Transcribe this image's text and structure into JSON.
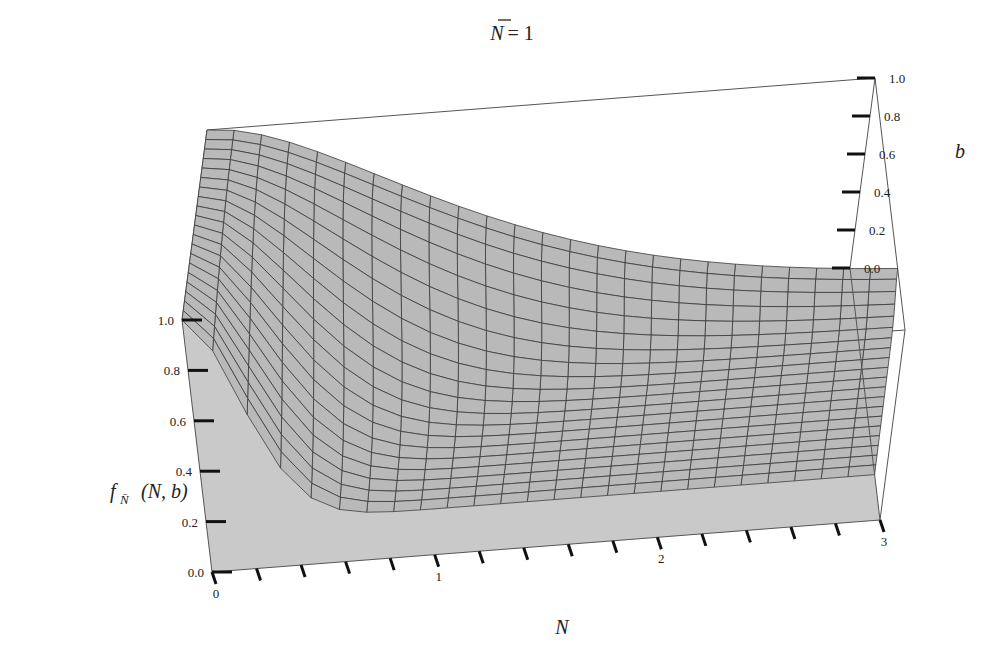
{
  "chart_data": {
    "type": "surface3d",
    "title_parts": {
      "var": "N",
      "eq": "= 1"
    },
    "xlabel": "N",
    "ylabel": "b",
    "zlabel": "f_N̄ (N, b)",
    "zlabel_parts": {
      "f": "f",
      "sub": "N̄",
      "args": "(N, b)"
    },
    "x_range": [
      0,
      3
    ],
    "y_range": [
      0,
      1
    ],
    "z_range": [
      0,
      1
    ],
    "x_ticks": [
      "0",
      "1",
      "2",
      "3"
    ],
    "y_ticks": [
      "0.0",
      "0.2",
      "0.4",
      "0.6",
      "0.8",
      "1.0"
    ],
    "z_ticks": [
      "0.0",
      "0.2",
      "0.4",
      "0.6",
      "0.8",
      "1.0"
    ],
    "grid_x_lines": 26,
    "grid_y_lines": 21,
    "surface_color": "#b9b9b9",
    "mesh_color": "#3a3a3a",
    "sample_points": [
      {
        "N": 0.0,
        "b": 0.0,
        "f": 1.0
      },
      {
        "N": 0.25,
        "b": 0.0,
        "f": 0.2
      },
      {
        "N": 3.0,
        "b": 0.0,
        "f": 0.18
      },
      {
        "N": 0.0,
        "b": 1.0,
        "f": 1.0
      },
      {
        "N": 1.0,
        "b": 1.0,
        "f": 0.62
      },
      {
        "N": 3.0,
        "b": 1.0,
        "f": 0.2
      }
    ]
  }
}
